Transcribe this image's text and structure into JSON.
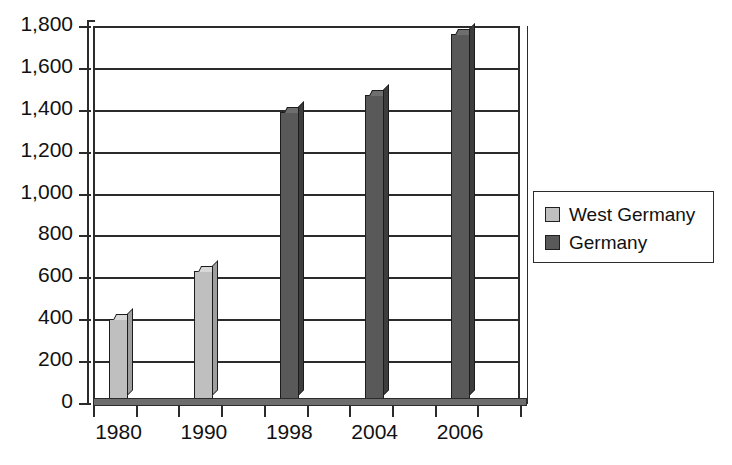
{
  "chart_data": {
    "type": "bar",
    "title": "",
    "subtitle": "",
    "xlabel": "",
    "ylabel": "",
    "categories": [
      "1980",
      "1990",
      "1998",
      "2004",
      "2006"
    ],
    "series": [
      {
        "name": "West Germany",
        "color": "#bfbfbf",
        "values": [
          400,
          630,
          null,
          null,
          null
        ]
      },
      {
        "name": "Germany",
        "color": "#595959",
        "values": [
          null,
          null,
          1390,
          1470,
          1760
        ]
      }
    ],
    "ylim": [
      0,
      1800
    ],
    "ytick_step": 200,
    "ytick_labels": [
      "0",
      "200",
      "400",
      "600",
      "800",
      "1,000",
      "1,200",
      "1,400",
      "1,600",
      "1,800"
    ],
    "ytick_values": [
      0,
      200,
      400,
      600,
      800,
      1000,
      1200,
      1400,
      1600,
      1800
    ],
    "grid": "horizontal",
    "legend_position": "right",
    "bars": [
      {
        "category": "1980",
        "series": "West Germany",
        "value": 400,
        "color": "#bfbfbf"
      },
      {
        "category": "1990",
        "series": "West Germany",
        "value": 630,
        "color": "#bfbfbf"
      },
      {
        "category": "1998",
        "series": "Germany",
        "value": 1390,
        "color": "#595959"
      },
      {
        "category": "2004",
        "series": "Germany",
        "value": 1470,
        "color": "#595959"
      },
      {
        "category": "2006",
        "series": "Germany",
        "value": 1760,
        "color": "#595959"
      }
    ]
  },
  "legend": {
    "items": [
      {
        "label": "West Germany",
        "color": "#bfbfbf"
      },
      {
        "label": "Germany",
        "color": "#595959"
      }
    ]
  },
  "colors": {
    "axis": "#2b2b2b",
    "background": "#ffffff",
    "text": "#111111",
    "west_germany": "#bfbfbf",
    "germany": "#595959"
  }
}
